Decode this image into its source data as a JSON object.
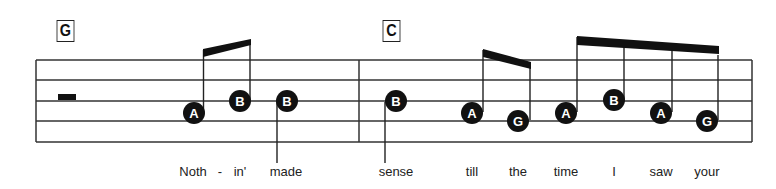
{
  "chords": [
    {
      "label": "G",
      "x": 55,
      "y": 20
    },
    {
      "label": "C",
      "x": 381,
      "y": 20
    }
  ],
  "staff": {
    "left": 36,
    "right": 752,
    "lines_y": [
      60,
      80,
      101,
      121,
      142
    ],
    "barline_x": 359
  },
  "rest": {
    "type": "half-rest",
    "x": 58,
    "y": 94,
    "w": 18,
    "h": 6
  },
  "notes": [
    {
      "label": "A",
      "x": 194,
      "y": 113,
      "stem": "up"
    },
    {
      "label": "B",
      "x": 240,
      "y": 101,
      "stem": "up"
    },
    {
      "label": "B",
      "x": 287,
      "y": 101,
      "stem": "down"
    },
    {
      "label": "B",
      "x": 396,
      "y": 101,
      "stem": "down"
    },
    {
      "label": "A",
      "x": 472,
      "y": 113,
      "stem": "up"
    },
    {
      "label": "G",
      "x": 518,
      "y": 121,
      "stem": "up"
    },
    {
      "label": "A",
      "x": 566,
      "y": 113,
      "stem": "up"
    },
    {
      "label": "B",
      "x": 614,
      "y": 100,
      "stem": "up"
    },
    {
      "label": "A",
      "x": 661,
      "y": 113,
      "stem": "up"
    },
    {
      "label": "G",
      "x": 707,
      "y": 121,
      "stem": "up"
    }
  ],
  "lyrics": [
    {
      "text": "Noth",
      "x": 193
    },
    {
      "text": "-",
      "x": 220
    },
    {
      "text": "in'",
      "x": 240
    },
    {
      "text": "made",
      "x": 286
    },
    {
      "text": "sense",
      "x": 396
    },
    {
      "text": "till",
      "x": 472
    },
    {
      "text": "the",
      "x": 518
    },
    {
      "text": "time",
      "x": 566
    },
    {
      "text": "I",
      "x": 614
    },
    {
      "text": "saw",
      "x": 661
    },
    {
      "text": "your",
      "x": 707
    }
  ]
}
